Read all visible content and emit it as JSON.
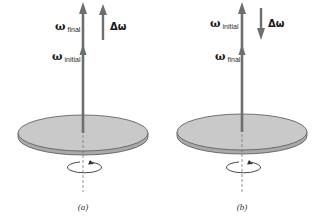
{
  "figure": {
    "panels": [
      {
        "id": "a",
        "caption": "(a)",
        "vector_labels": {
          "top": {
            "symbol": "ω",
            "subscript": "final"
          },
          "lower": {
            "symbol": "ω",
            "subscript": "initial"
          }
        },
        "delta": {
          "label": "Δω",
          "direction": "up"
        }
      },
      {
        "id": "b",
        "caption": "(b)",
        "vector_labels": {
          "top": {
            "symbol": "ω",
            "subscript": "initial"
          },
          "lower": {
            "symbol": "ω",
            "subscript": "final"
          }
        },
        "delta": {
          "label": "Δω",
          "direction": "down"
        }
      }
    ],
    "colors": {
      "arrow": "#6e6e6e",
      "disc_top": "#c8c8c8",
      "disc_edge": "#555555",
      "axis_dash": "#777777"
    }
  }
}
